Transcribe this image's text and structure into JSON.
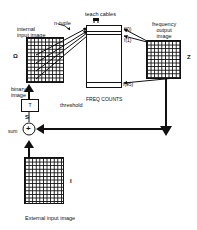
{
  "diagram": {
    "labels": {
      "internal_input_image": "internal\ninput image",
      "n_tuple": "n-tuple",
      "teach_cables": "teach cables",
      "frequency_output_image": "frequency\noutput\nimage",
      "freq_counts": "FREQ COUNTS",
      "binary_image": "binary\nimage",
      "threshold": "threshold",
      "threshold_box": "T",
      "sum_symbol": "S",
      "sum_label": "sum",
      "sum_operator": "+",
      "external_input_image": "External input image"
    },
    "symbols": {
      "omega": "Ω",
      "z": "Z",
      "i": "I"
    },
    "counter_labels": {
      "f0": "f(0)",
      "f1": "f(1)",
      "f95": "f(95)"
    },
    "colors": {
      "ink": "#111111",
      "background": "#ffffff"
    }
  }
}
